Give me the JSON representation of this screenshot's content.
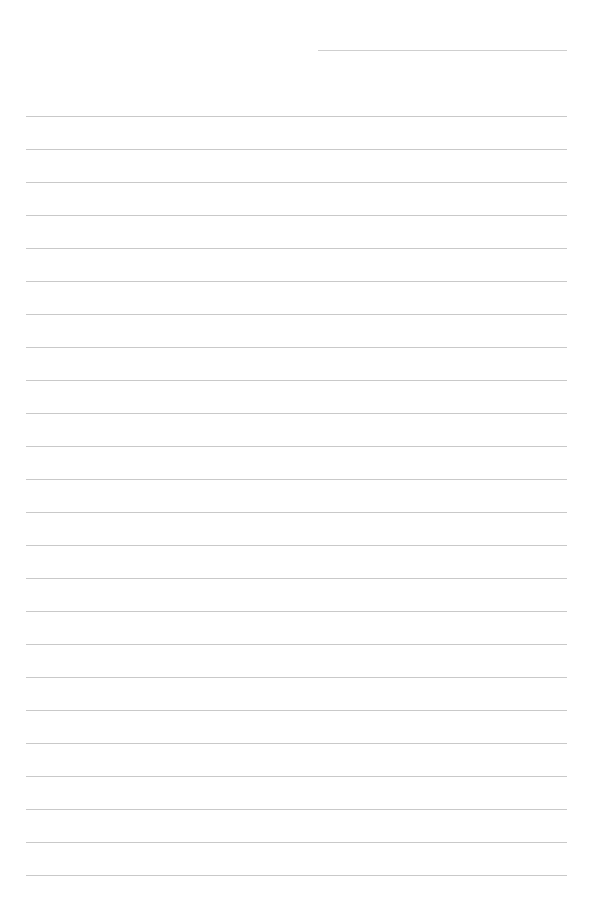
{
  "page": {
    "type": "lined-paper",
    "background_color": "#ffffff",
    "line_color": "#c9c9c9",
    "header_line": {
      "x": 318,
      "y": 50,
      "width": 249
    },
    "ruled_lines": {
      "count": 24,
      "x": 26,
      "width": 541,
      "first_y": 116,
      "spacing": 33
    }
  }
}
